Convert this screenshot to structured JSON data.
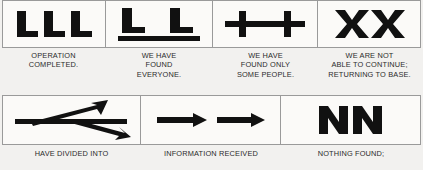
{
  "document": {
    "type": "ground-to-air-emergency-signal-chart",
    "style": {
      "ink": "#111111",
      "border": "#9a9a9a",
      "paper": "#fbfaf8",
      "page_background": "#f2f1ef",
      "caption_color": "#2b2b2b"
    }
  },
  "rows": [
    {
      "name": "top-row",
      "cells": [
        {
          "symbol_name": "three-l-symbol",
          "symbol_text": "L L L",
          "caption": "OPERATION\nCOMPLETED."
        },
        {
          "symbol_name": "two-l-with-underline-symbol",
          "symbol_text": "L L",
          "caption": "WE HAVE\nFOUND\nEVERYONE."
        },
        {
          "symbol_name": "double-plus-linked-symbol",
          "symbol_text": "+—+",
          "caption": "WE HAVE\nFOUND ONLY\nSOME PEOPLE."
        },
        {
          "symbol_name": "double-x-symbol",
          "symbol_text": "X X",
          "caption": "WE ARE NOT\nABLE TO CONTINUE;\nRETURNING TO BASE."
        }
      ]
    },
    {
      "name": "bottom-row",
      "cells": [
        {
          "symbol_name": "forked-double-arrow-symbol",
          "symbol_text": "split arrow",
          "caption": "HAVE DIVIDED INTO"
        },
        {
          "symbol_name": "two-right-arrows-symbol",
          "symbol_text": "→  →",
          "caption": "INFORMATION RECEIVED"
        },
        {
          "symbol_name": "double-n-symbol",
          "symbol_text": "N N",
          "caption": "NOTHING FOUND;"
        }
      ]
    }
  ]
}
